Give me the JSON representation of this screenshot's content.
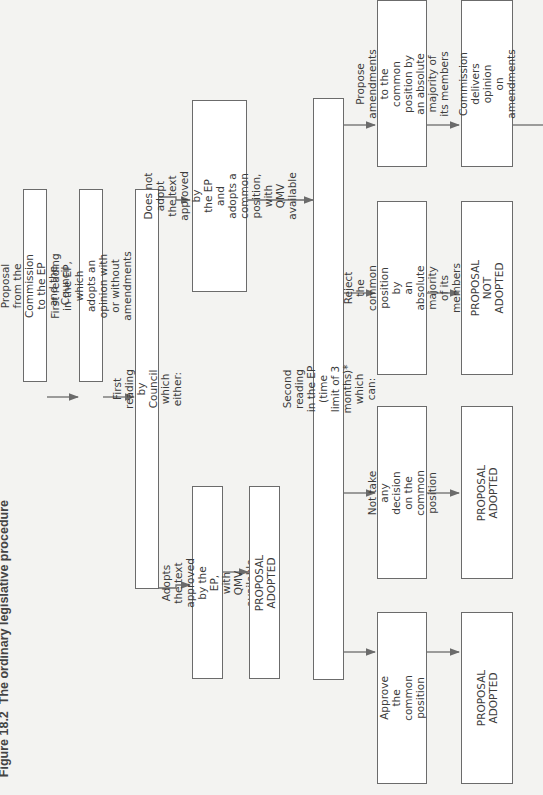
{
  "figure": {
    "title_number": "Figure 18.2",
    "title_text": "The ordinary legislative procedure"
  },
  "nodes": {
    "proposal": "Proposal from the Commission to the EP and the Council",
    "first_reading_ep": "First reading in the EP, which adopts an opinion with or without amendments",
    "first_reading_council": "First reading by Council which either:",
    "adopts_text": "Adopts the text approved by the EP,\nwith QMV available",
    "adopted_1": "PROPOSAL ADOPTED",
    "not_adopt_text": "Does not adopt the text approved by\nthe EP and adopts a common\nposition, with QMV available",
    "second_reading": "Second reading in the EP (time limit of 3 months)* which can:",
    "approve_common": "Approve the common position",
    "adopted_2": "PROPOSAL ADOPTED",
    "no_decision": "Not take any decision on the\ncommon position",
    "adopted_3": "PROPOSAL ADOPTED",
    "reject_common": "Reject the common position by\nan absolute majority of its\nmembers",
    "not_adopted": "PROPOSAL NOT ADOPTED",
    "propose_amendments": "Propose amendments to the\ncommon position by an absolute\nmajority of its members",
    "commission_opinion": "Commission delivers opinion\non amendments"
  },
  "colors": {
    "background": "#f3f3f1",
    "box_fill": "#ffffff",
    "line": "#6b6b6b"
  }
}
